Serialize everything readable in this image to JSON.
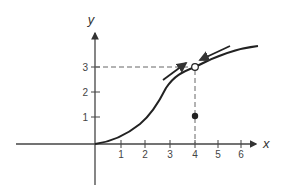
{
  "diagram": {
    "type": "sigmoid-curve-with-fixed-point",
    "axes": {
      "x_label": "x",
      "y_label": "y",
      "x_ticks": [
        "1",
        "2",
        "3",
        "4",
        "5",
        "6"
      ],
      "y_ticks": [
        "1",
        "2",
        "3"
      ]
    },
    "points": {
      "open_circle": {
        "x": 4,
        "y": 3
      },
      "filled_dot": {
        "x": 4,
        "y": 1.1
      }
    },
    "arrows": [
      {
        "direction": "up-right",
        "description": "approach from below along curve"
      },
      {
        "direction": "down-left",
        "description": "approach from above along curve"
      }
    ],
    "colors": {
      "curve": "#222222",
      "axes": "#444444",
      "dashed": "#666666"
    }
  }
}
